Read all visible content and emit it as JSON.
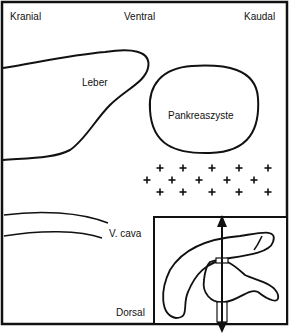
{
  "diagram": {
    "orientation": {
      "top_left": "Kranial",
      "top_center": "Ventral",
      "top_right": "Kaudal",
      "bottom": "Dorsal"
    },
    "structures": {
      "liver": "Leber",
      "cyst": "Pankreaszyste",
      "vena_cava": "V. cava"
    },
    "markers": {
      "symbol": "+",
      "rows": [
        {
          "y": 168,
          "x": [
            160,
            183,
            212,
            239,
            268
          ]
        },
        {
          "y": 180,
          "x": [
            147,
            172,
            199,
            227,
            254
          ]
        },
        {
          "y": 192,
          "x": [
            160,
            183,
            212,
            239,
            268
          ]
        }
      ]
    },
    "inset": {
      "description": "Transducer position schematic over pancreas"
    },
    "colors": {
      "line": "#111111",
      "background": "#ffffff"
    }
  }
}
